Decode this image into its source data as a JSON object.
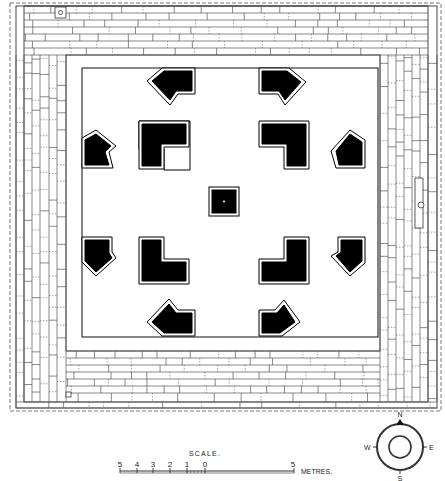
{
  "plan": {
    "title": "Site plan of pillared court",
    "outer_boundary": "dashed",
    "court": {
      "x": 82,
      "y": 68,
      "w": 296,
      "h": 269
    },
    "central_pillar": {
      "x": 210,
      "y": 188,
      "w": 28,
      "h": 27
    },
    "markers": [
      {
        "name": "top-left-square-marker",
        "x": 55,
        "y": 8
      },
      {
        "name": "bottom-left-square-marker",
        "x": 66,
        "y": 392
      },
      {
        "name": "right-wall-circle-marker",
        "x": 421,
        "y": 205
      }
    ]
  },
  "scale": {
    "title": "SCALE.",
    "ticks": [
      "5",
      "4",
      "3",
      "2",
      "1",
      "0"
    ],
    "end_tick": "5",
    "unit": "METRES."
  },
  "compass": {
    "north": "N",
    "south": "S",
    "east": "E",
    "west": "W"
  }
}
